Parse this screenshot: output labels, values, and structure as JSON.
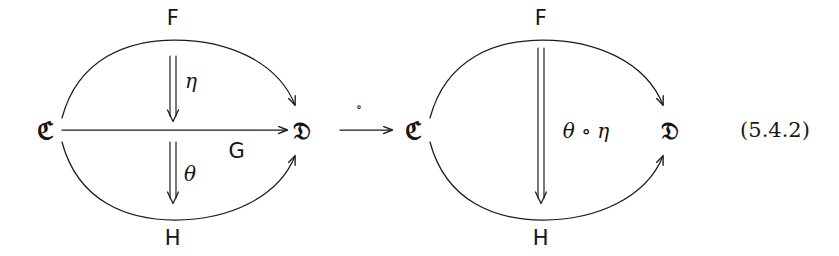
{
  "figure": {
    "equation_number": "(5.4.2)",
    "background_color": "#ffffff",
    "stroke_color": "#1a1a1a",
    "left_diagram": {
      "source_object": "ℭ",
      "target_object": "𝔇",
      "top_functor": "F",
      "middle_functor": "G",
      "bottom_functor": "H",
      "upper_transformation": "η",
      "lower_transformation": "θ"
    },
    "middle_operator": {
      "symbol": "∘",
      "arrow": "⟶"
    },
    "right_diagram": {
      "source_object": "ℭ",
      "target_object": "𝔇",
      "top_functor": "F",
      "bottom_functor": "H",
      "composed_transformation": "θ ∘ η"
    }
  }
}
